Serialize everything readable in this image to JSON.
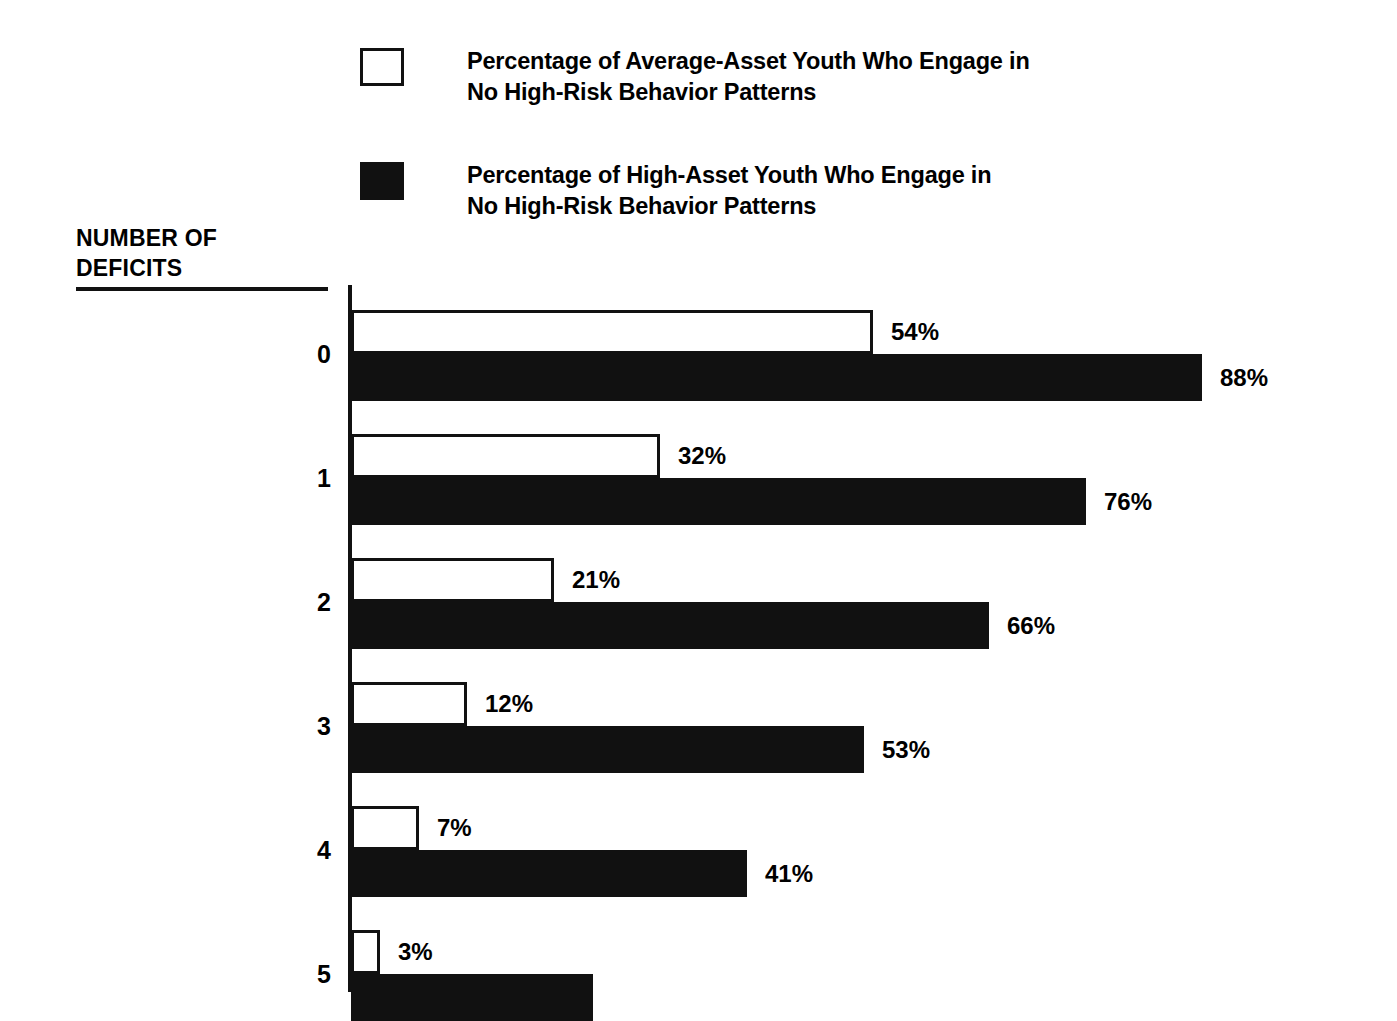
{
  "legend": {
    "items": [
      {
        "swatch": "open-square-swatch",
        "label": "Percentage of Average-Asset Youth Who Engage in\nNo High-Risk Behavior Patterns",
        "color": "#ffffff"
      },
      {
        "swatch": "filled-square-swatch",
        "label": "Percentage of High-Asset Youth Who Engage in\nNo High-Risk Behavior Patterns",
        "color": "#111111"
      }
    ]
  },
  "axis": {
    "title": "NUMBER OF\nDEFICITS"
  },
  "chart_data": {
    "type": "bar",
    "orientation": "horizontal",
    "title": "",
    "xlabel": "",
    "ylabel": "NUMBER OF DEFICITS",
    "categories": [
      "0",
      "1",
      "2",
      "3",
      "4",
      "5"
    ],
    "xlim": [
      0,
      100
    ],
    "grid": false,
    "legend_position": "top-left",
    "value_suffix": "%",
    "series": [
      {
        "name": "Percentage of Average-Asset Youth Who Engage in No High-Risk Behavior Patterns",
        "color": "#ffffff",
        "style": "open",
        "values": [
          54,
          32,
          21,
          12,
          7,
          3
        ],
        "labels": [
          "54%",
          "32%",
          "21%",
          "12%",
          "7%",
          "3%"
        ]
      },
      {
        "name": "Percentage of High-Asset Youth Who Engage in No High-Risk Behavior Patterns",
        "color": "#111111",
        "style": "filled",
        "values": [
          88,
          76,
          66,
          53,
          41,
          25
        ],
        "labels": [
          "88%",
          "76%",
          "66%",
          "53%",
          "41%",
          ""
        ]
      }
    ]
  }
}
